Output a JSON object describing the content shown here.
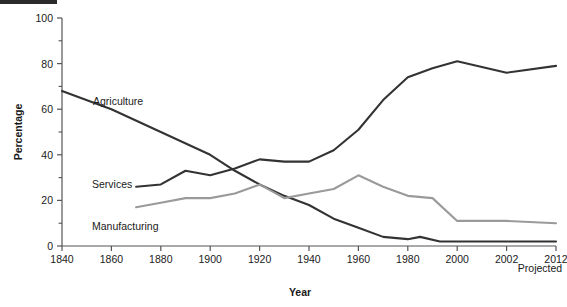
{
  "figure": {
    "background_color": "#ffffff",
    "crop_bar_color": "#2b2b2b"
  },
  "axes": {
    "x_title": "Year",
    "y_title": "Percentage",
    "x_tick_labels": [
      "1840",
      "1860",
      "1880",
      "1900",
      "1920",
      "1940",
      "1960",
      "1980",
      "2000",
      "2002",
      "2012"
    ],
    "y_tick_labels": [
      "0",
      "20",
      "40",
      "60",
      "80",
      "100"
    ],
    "projected_note": "Projected"
  },
  "series_labels": {
    "agriculture": "Agriculture",
    "services": "Services",
    "manufacturing": "Manufacturing"
  },
  "chart_data": {
    "type": "line",
    "title": "",
    "subtitle": "",
    "xlabel": "Year",
    "ylabel": "Percentage",
    "xlim": [
      1840,
      2012
    ],
    "ylim": [
      0,
      100
    ],
    "grid": false,
    "legend_position": "inline-annotations",
    "x_tick_values": [
      1840,
      1860,
      1880,
      1900,
      1920,
      1940,
      1960,
      1980,
      2000,
      2002,
      2012
    ],
    "y_tick_values": [
      0,
      20,
      40,
      60,
      80,
      100
    ],
    "y_minor_tick_values": [
      10,
      30,
      50,
      70,
      90
    ],
    "annotations": [
      {
        "text": "Projected",
        "x": 2012,
        "y": -8
      },
      {
        "text": "Agriculture",
        "x": 1872,
        "y": 65
      },
      {
        "text": "Services",
        "x": 1868,
        "y": 29
      },
      {
        "text": "Manufacturing",
        "x": 1872,
        "y": 12
      }
    ],
    "series": [
      {
        "name": "Agriculture",
        "color": "#333333",
        "x": [
          1840,
          1860,
          1880,
          1900,
          1910,
          1920,
          1930,
          1940,
          1950,
          1960,
          1970,
          1980,
          1985,
          1993,
          2000,
          2002,
          2012
        ],
        "values": [
          68,
          60,
          50,
          40,
          33,
          27,
          22,
          18,
          12,
          8,
          4,
          3,
          4,
          2,
          2,
          2,
          2
        ]
      },
      {
        "name": "Services",
        "color": "#333333",
        "x": [
          1870,
          1880,
          1890,
          1900,
          1910,
          1920,
          1930,
          1940,
          1950,
          1960,
          1970,
          1980,
          1990,
          2000,
          2002,
          2012
        ],
        "values": [
          26,
          27,
          33,
          31,
          34,
          38,
          37,
          37,
          42,
          51,
          64,
          74,
          78,
          81,
          76,
          79
        ]
      },
      {
        "name": "Manufacturing",
        "color": "#9a9a9a",
        "x": [
          1870,
          1880,
          1890,
          1900,
          1910,
          1920,
          1930,
          1940,
          1950,
          1960,
          1970,
          1980,
          1990,
          2000,
          2002,
          2012
        ],
        "values": [
          17,
          19,
          21,
          21,
          23,
          27,
          21,
          23,
          25,
          31,
          26,
          22,
          21,
          11,
          11,
          10
        ]
      }
    ]
  }
}
